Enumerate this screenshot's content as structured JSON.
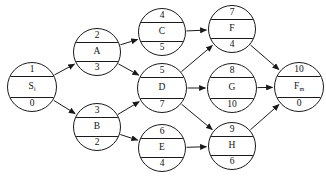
{
  "diagram": {
    "type": "activity-network",
    "title": "",
    "canvas": {
      "width": 326,
      "height": 180
    },
    "node_shape": "circle-three-row",
    "row_meaning": {
      "top": "node number",
      "middle": "activity label",
      "bottom": "duration"
    },
    "colors": {
      "stroke": "#1a1a1a",
      "fill": "#ffffff",
      "text": "#111111"
    },
    "nodes": [
      {
        "id": "1",
        "number": "1",
        "label": "S",
        "label_sub": "i",
        "duration": "0",
        "cx": 32,
        "cy": 87,
        "r": 25
      },
      {
        "id": "2",
        "number": "2",
        "label": "A",
        "label_sub": "",
        "duration": "3",
        "cx": 97,
        "cy": 52,
        "r": 24
      },
      {
        "id": "3",
        "number": "3",
        "label": "B",
        "label_sub": "",
        "duration": "2",
        "cx": 97,
        "cy": 127,
        "r": 24
      },
      {
        "id": "4",
        "number": "4",
        "label": "C",
        "label_sub": "",
        "duration": "5",
        "cx": 162,
        "cy": 32,
        "r": 24
      },
      {
        "id": "5",
        "number": "5",
        "label": "D",
        "label_sub": "",
        "duration": "7",
        "cx": 162,
        "cy": 88,
        "r": 25
      },
      {
        "id": "6",
        "number": "6",
        "label": "E",
        "label_sub": "",
        "duration": "4",
        "cx": 162,
        "cy": 148,
        "r": 24
      },
      {
        "id": "7",
        "number": "7",
        "label": "F",
        "label_sub": "",
        "duration": "4",
        "cx": 232,
        "cy": 29,
        "r": 24
      },
      {
        "id": "8",
        "number": "8",
        "label": "G",
        "label_sub": "",
        "duration": "10",
        "cx": 232,
        "cy": 88,
        "r": 25
      },
      {
        "id": "9",
        "number": "9",
        "label": "H",
        "label_sub": "",
        "duration": "6",
        "cx": 232,
        "cy": 146,
        "r": 24
      },
      {
        "id": "10",
        "number": "10",
        "label": "F",
        "label_sub": "m",
        "duration": "0",
        "cx": 299,
        "cy": 87,
        "r": 25
      }
    ],
    "edges": [
      {
        "from": "1",
        "to": "2"
      },
      {
        "from": "1",
        "to": "3"
      },
      {
        "from": "2",
        "to": "4"
      },
      {
        "from": "2",
        "to": "5"
      },
      {
        "from": "3",
        "to": "5"
      },
      {
        "from": "3",
        "to": "6"
      },
      {
        "from": "4",
        "to": "7"
      },
      {
        "from": "5",
        "to": "7"
      },
      {
        "from": "5",
        "to": "8"
      },
      {
        "from": "5",
        "to": "9"
      },
      {
        "from": "6",
        "to": "9"
      },
      {
        "from": "7",
        "to": "10"
      },
      {
        "from": "8",
        "to": "10"
      },
      {
        "from": "9",
        "to": "10"
      }
    ]
  }
}
